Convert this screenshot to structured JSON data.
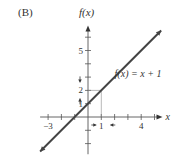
{
  "panel_label": "(B)",
  "chart_data": {
    "type": "line",
    "title": "",
    "xlabel": "x",
    "ylabel": "f(x)",
    "xlim": [
      -3.6,
      5.6
    ],
    "ylim": [
      -2.8,
      6.8
    ],
    "x_ticks": [
      -3,
      -2,
      -1,
      0,
      1,
      2,
      3,
      4,
      5
    ],
    "y_ticks": [
      -2,
      -1,
      1,
      2,
      3,
      4,
      5,
      6
    ],
    "x_tick_labels": [
      {
        "value": -3,
        "label": "−3"
      },
      {
        "value": 1,
        "label": "1"
      },
      {
        "value": 4,
        "label": "4"
      }
    ],
    "y_tick_labels": [
      {
        "value": 5,
        "label": "5"
      },
      {
        "value": 2,
        "label": "2"
      },
      {
        "value": 1,
        "label": "1"
      }
    ],
    "grid": false,
    "series": [
      {
        "name": "f(x) = x + 1",
        "slope": 1,
        "intercept": 1,
        "x": [
          -3.6,
          5.5
        ],
        "y": [
          -2.6,
          6.5
        ],
        "color": "#444444"
      }
    ],
    "annotations": [
      {
        "text": "f(x) = x + 1",
        "at": {
          "x": 2.6,
          "y": 3.4
        }
      },
      {
        "type": "guide-lines",
        "point": {
          "x": 1,
          "y": 2
        }
      },
      {
        "type": "arrows-inward-x",
        "around": 1
      },
      {
        "type": "arrows-inward-y",
        "around": 2
      }
    ]
  }
}
